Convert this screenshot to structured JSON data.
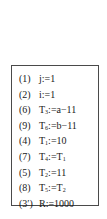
{
  "code_block": {
    "lines": [
      {
        "num": "(1)",
        "var": "j",
        "sub": "",
        "op": ":=",
        "expr": "1",
        "expr_sub": ""
      },
      {
        "num": "(2)",
        "var": "i",
        "sub": "",
        "op": ":=",
        "expr": "1",
        "expr_sub": ""
      },
      {
        "num": "(6)",
        "var": "T",
        "sub": "3",
        "op": ":=",
        "expr": "a−11",
        "expr_sub": ""
      },
      {
        "num": "(9)",
        "var": "T",
        "sub": "6",
        "op": ":=",
        "expr": "b−11",
        "expr_sub": ""
      },
      {
        "num": "(4)",
        "var": "T",
        "sub": "1",
        "op": ":=",
        "expr": "10",
        "expr_sub": ""
      },
      {
        "num": "(7)",
        "var": "T",
        "sub": "4",
        "op": ":=",
        "expr": "T",
        "expr_sub": "1"
      },
      {
        "num": "(5)",
        "var": "T",
        "sub": "2",
        "op": ":=",
        "expr": "11",
        "expr_sub": ""
      },
      {
        "num": "(8)",
        "var": "T",
        "sub": "5",
        "op": ":=",
        "expr": "T",
        "expr_sub": "2"
      },
      {
        "num": "(3′)",
        "var": "R",
        "sub": "",
        "op": ":=",
        "expr": "1000",
        "expr_sub": ""
      }
    ]
  }
}
